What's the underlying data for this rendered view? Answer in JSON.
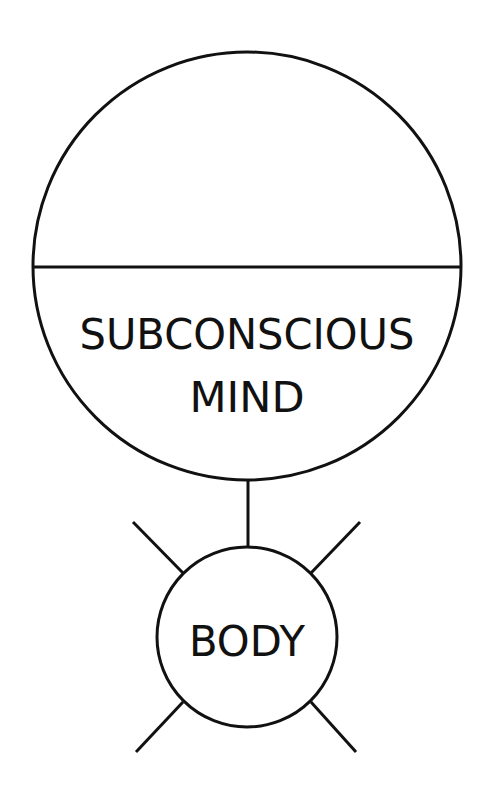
{
  "diagram": {
    "mind": {
      "label_line1": "SUBCONSCIOUS",
      "label_line2": "MIND"
    },
    "body": {
      "label": "BODY"
    },
    "colors": {
      "stroke": "#111111",
      "background": "#ffffff"
    }
  }
}
